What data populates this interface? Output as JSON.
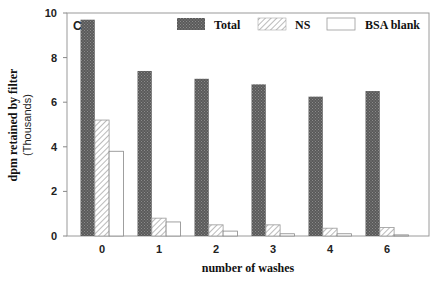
{
  "chart_data": {
    "type": "bar",
    "title": "",
    "panel_label": "C",
    "xlabel": "number of washes",
    "ylabel": "dpm retained by filter",
    "ylabel_sub": "(Thousands)",
    "categories": [
      "0",
      "1",
      "2",
      "3",
      "4",
      "6"
    ],
    "series": [
      {
        "name": "Total",
        "pattern": "crosshatch-dark",
        "values": [
          9.7,
          7.4,
          7.05,
          6.8,
          6.25,
          6.5
        ]
      },
      {
        "name": "NS",
        "pattern": "diagonal-hatch",
        "values": [
          5.2,
          0.8,
          0.5,
          0.5,
          0.35,
          0.38
        ]
      },
      {
        "name": "BSA blank",
        "pattern": "white",
        "values": [
          3.8,
          0.63,
          0.22,
          0.1,
          0.1,
          0.05
        ]
      }
    ],
    "ylim": [
      0,
      10
    ],
    "yticks": [
      0,
      2,
      4,
      6,
      8,
      10
    ],
    "grid": false,
    "legend_position": "top-right-inside"
  },
  "colors": {
    "total_fill": "#555555",
    "axis": "#888888",
    "text": "#111111"
  }
}
